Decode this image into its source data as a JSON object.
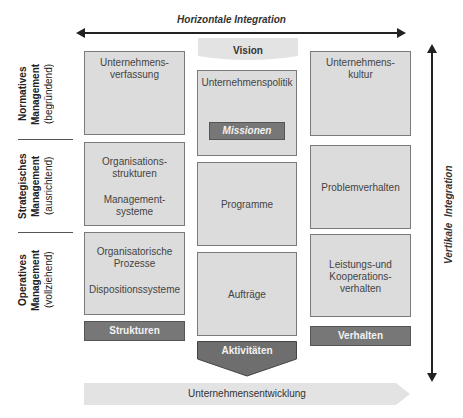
{
  "top_axis": {
    "label": "Horizontale Integration"
  },
  "right_axis": {
    "label": "Vertikale  Integration"
  },
  "vision": {
    "label": "Vision"
  },
  "rows": [
    {
      "name": "Normatives",
      "sub": "Management",
      "paren": "(begründend)"
    },
    {
      "name": "Strategisches",
      "sub": "Management",
      "paren": "(ausrichtend)"
    },
    {
      "name": "Operatives",
      "sub": "Management",
      "paren": "(vollziehend)"
    }
  ],
  "left_column": {
    "boxes": [
      {
        "line1": "Unternehmens-",
        "line2": "verfassung"
      },
      {
        "line1": "Organisations-",
        "line2": "strukturen",
        "line3": "Management-",
        "line4": "systeme"
      },
      {
        "line1": "Organisatorische",
        "line2": "Prozesse",
        "line3": "Dispositionssysteme"
      }
    ],
    "footer": "Strukturen"
  },
  "center_column": {
    "boxes": [
      {
        "label": "Unternehmenspolitik",
        "inner": "Missionen"
      },
      {
        "label": "Programme"
      },
      {
        "label": "Aufträge"
      }
    ],
    "footer": "Aktivitäten"
  },
  "right_column": {
    "boxes": [
      {
        "line1": "Unternehmens-",
        "line2": "kultur"
      },
      {
        "line1": "Problemverhalten"
      },
      {
        "line1": "Leistungs-und",
        "line2": "Kooperations-",
        "line3": "verhalten"
      }
    ],
    "footer": "Verhalten"
  },
  "bottom_arrow": {
    "label": "Unternehmensentwicklung"
  },
  "colors": {
    "box_fill": "#dcdcdc",
    "dark_fill": "#777777",
    "arrow_fill": "#e3e3e3",
    "line": "#222222"
  }
}
